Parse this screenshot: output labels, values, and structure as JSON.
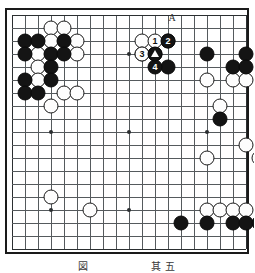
{
  "board": {
    "size": 19,
    "origin_x": 12,
    "origin_y": 15,
    "spacing": 13,
    "line_color": "#555a5d",
    "edge_color": "#2b2f31",
    "background": "#ffffff",
    "black_color": "#141414",
    "white_color": "#fdfdfd",
    "hoshi": [
      [
        4,
        4
      ],
      [
        10,
        4
      ],
      [
        16,
        4
      ],
      [
        4,
        10
      ],
      [
        10,
        10
      ],
      [
        16,
        10
      ],
      [
        4,
        16
      ],
      [
        10,
        16
      ],
      [
        16,
        16
      ]
    ]
  },
  "stones": {
    "black": [
      [
        2,
        3
      ],
      [
        3,
        3
      ],
      [
        5,
        3
      ],
      [
        2,
        4
      ],
      [
        4,
        4
      ],
      [
        5,
        4
      ],
      [
        4,
        5
      ],
      [
        2,
        6
      ],
      [
        4,
        6
      ],
      [
        2,
        7
      ],
      [
        3,
        7
      ],
      [
        13,
        3
      ],
      [
        12,
        4
      ],
      [
        16,
        4
      ],
      [
        19,
        4
      ],
      [
        13,
        5
      ],
      [
        18,
        5
      ],
      [
        19,
        5
      ],
      [
        17,
        9
      ],
      [
        14,
        17
      ],
      [
        16,
        17
      ],
      [
        18,
        17
      ],
      [
        19,
        17
      ],
      [
        20,
        17
      ]
    ],
    "white": [
      [
        4,
        2
      ],
      [
        5,
        2
      ],
      [
        4,
        3
      ],
      [
        6,
        3
      ],
      [
        3,
        4
      ],
      [
        6,
        4
      ],
      [
        3,
        5
      ],
      [
        3,
        6
      ],
      [
        5,
        7
      ],
      [
        6,
        7
      ],
      [
        4,
        8
      ],
      [
        11,
        3
      ],
      [
        11,
        4
      ],
      [
        16,
        6
      ],
      [
        18,
        6
      ],
      [
        19,
        6
      ],
      [
        17,
        8
      ],
      [
        19,
        11
      ],
      [
        16,
        12
      ],
      [
        20,
        12
      ],
      [
        4,
        15
      ],
      [
        7,
        16
      ],
      [
        16,
        16
      ],
      [
        17,
        16
      ],
      [
        18,
        16
      ],
      [
        19,
        16
      ]
    ]
  },
  "markers": {
    "numbered": [
      {
        "label": "1",
        "color": "white",
        "col": 12,
        "row": 3
      },
      {
        "label": "2",
        "color": "black",
        "col": 13,
        "row": 3
      },
      {
        "label": "3",
        "color": "white",
        "col": 11,
        "row": 4
      },
      {
        "label": "4",
        "color": "black",
        "col": 12,
        "row": 5
      }
    ],
    "triangles": [
      {
        "on": "black",
        "col": 12,
        "row": 4
      }
    ],
    "point_labels": [
      {
        "label": "A",
        "col": 13,
        "row": 1,
        "text_x": 172,
        "text_y": 23
      }
    ]
  },
  "caption": {
    "text": "図 　 　 　 　 其 五"
  }
}
